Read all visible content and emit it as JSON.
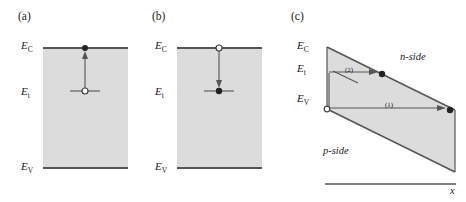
{
  "figure": {
    "type": "band-diagram",
    "panels": [
      {
        "id": "a",
        "label": "(a)",
        "energy_levels": [
          {
            "name": "E_C",
            "sym": "E",
            "sub": "C"
          },
          {
            "name": "E_t",
            "sym": "E",
            "sub": "t"
          },
          {
            "name": "E_V",
            "sym": "E",
            "sub": "V"
          }
        ],
        "process": "electron emission from trap to conduction band",
        "arrow_direction": "up",
        "markers": [
          {
            "at": "E_C",
            "fill": "filled"
          },
          {
            "at": "E_t",
            "fill": "open"
          }
        ]
      },
      {
        "id": "b",
        "label": "(b)",
        "energy_levels": [
          {
            "name": "E_C",
            "sym": "E",
            "sub": "C"
          },
          {
            "name": "E_t",
            "sym": "E",
            "sub": "t"
          },
          {
            "name": "E_V",
            "sym": "E",
            "sub": "V"
          }
        ],
        "process": "electron capture from conduction band into trap",
        "arrow_direction": "down",
        "markers": [
          {
            "at": "E_C",
            "fill": "open"
          },
          {
            "at": "E_t",
            "fill": "filled"
          }
        ]
      },
      {
        "id": "c",
        "label": "(c)",
        "energy_levels": [
          {
            "name": "E_C",
            "sym": "E",
            "sub": "C"
          },
          {
            "name": "E_t",
            "sym": "E",
            "sub": "t"
          },
          {
            "name": "E_V",
            "sym": "E",
            "sub": "V"
          }
        ],
        "region_labels": {
          "upper_right": "n-side",
          "lower_left": "p-side"
        },
        "axis_label": "x",
        "transitions": [
          {
            "id": "1",
            "label": "(1)",
            "from": "E_V",
            "to": "valence-band n-side",
            "marker": "filled"
          },
          {
            "id": "2",
            "label": "(2)",
            "from": "E_t",
            "to": "conduction-band n-side",
            "marker": "filled"
          }
        ]
      }
    ],
    "colors": {
      "band_fill": "#dcdcdc",
      "line": "#555555",
      "text": "#1a1a1a",
      "marker_fill": "#222222"
    }
  }
}
